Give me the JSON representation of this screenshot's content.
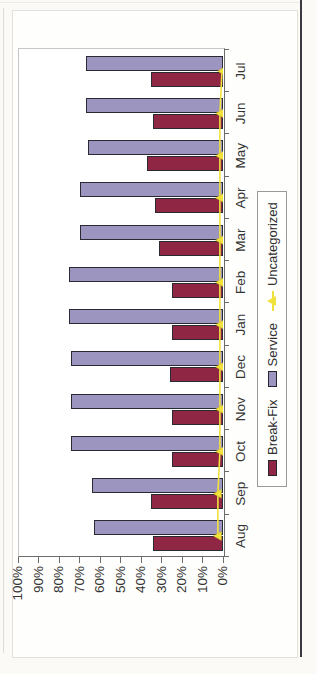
{
  "chart_data": {
    "type": "bar",
    "title": "",
    "xlabel": "",
    "ylabel": "",
    "categories": [
      "Aug",
      "Sep",
      "Oct",
      "Nov",
      "Dec",
      "Jan",
      "Feb",
      "Mar",
      "Apr",
      "May",
      "Jun",
      "Jul"
    ],
    "series": [
      {
        "name": "Break-Fix",
        "type": "bar",
        "color": "#8E2644",
        "values": [
          34,
          35,
          25,
          25,
          26,
          25,
          25,
          31,
          33,
          37,
          34,
          35
        ]
      },
      {
        "name": "Service",
        "type": "bar",
        "color": "#9C95C0",
        "values": [
          63,
          64,
          74,
          74,
          74,
          75,
          75,
          70,
          70,
          66,
          67,
          67
        ]
      },
      {
        "name": "Uncategorized",
        "type": "line",
        "color": "#F2E23C",
        "values": [
          2,
          2,
          1,
          1,
          1,
          1,
          1,
          1,
          1,
          1,
          1,
          0
        ]
      }
    ],
    "ylim": [
      0,
      100
    ],
    "ytick_labels": [
      "0%",
      "10%",
      "20%",
      "30%",
      "40%",
      "50%",
      "60%",
      "70%",
      "80%",
      "90%",
      "100%"
    ],
    "legend_position": "bottom",
    "grid": false,
    "layout_note": "chart image is rotated 90 degrees counter-clockwise; month axis reads bottom-to-top on the right, percent axis reads left-to-right along the bottom"
  },
  "colors": {
    "bar_border": "#2A2A33",
    "axis": "#6B6B6B",
    "plot_border": "#C6C6C4",
    "text": "#2E2E2E",
    "page_edge_line": "#3A3A40",
    "background": "#FBFAF6"
  }
}
